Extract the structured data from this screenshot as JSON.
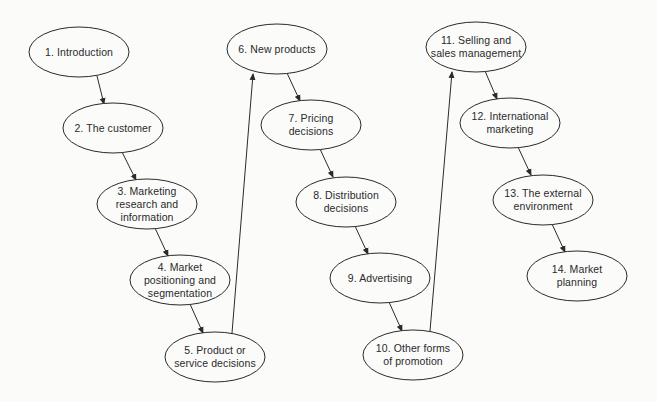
{
  "diagram": {
    "type": "flowchart",
    "background": "#fbfbfa",
    "stroke_color": "#2a2a2a",
    "nodes": [
      {
        "id": 1,
        "label": "1. Introduction",
        "cx": 79,
        "cy": 52,
        "rx": 50,
        "ry": 25
      },
      {
        "id": 2,
        "label": "2. The customer",
        "cx": 113,
        "cy": 128,
        "rx": 50,
        "ry": 25
      },
      {
        "id": 3,
        "label": "3. Marketing\nresearch and\ninformation",
        "cx": 147,
        "cy": 204,
        "rx": 50,
        "ry": 25
      },
      {
        "id": 4,
        "label": "4. Market\npositioning and\nsegmentation",
        "cx": 180,
        "cy": 280,
        "rx": 50,
        "ry": 25
      },
      {
        "id": 5,
        "label": "5. Product or\nservice decisions",
        "cx": 215,
        "cy": 357,
        "rx": 50,
        "ry": 25
      },
      {
        "id": 6,
        "label": "6. New products",
        "cx": 277,
        "cy": 49,
        "rx": 50,
        "ry": 25
      },
      {
        "id": 7,
        "label": "7. Pricing\ndecisions",
        "cx": 311,
        "cy": 125,
        "rx": 50,
        "ry": 25
      },
      {
        "id": 8,
        "label": "8. Distribution\ndecisions",
        "cx": 346,
        "cy": 202,
        "rx": 50,
        "ry": 25
      },
      {
        "id": 9,
        "label": "9. Advertising",
        "cx": 380,
        "cy": 278,
        "rx": 50,
        "ry": 25
      },
      {
        "id": 10,
        "label": "10. Other forms\nof promotion",
        "cx": 413,
        "cy": 355,
        "rx": 50,
        "ry": 25
      },
      {
        "id": 11,
        "label": "11. Selling and\nsales management",
        "cx": 476,
        "cy": 47,
        "rx": 50,
        "ry": 25
      },
      {
        "id": 12,
        "label": "12. International\nmarketing",
        "cx": 510,
        "cy": 123,
        "rx": 50,
        "ry": 25
      },
      {
        "id": 13,
        "label": "13. The external\nenvironment",
        "cx": 543,
        "cy": 200,
        "rx": 50,
        "ry": 25
      },
      {
        "id": 14,
        "label": "14. Market\nplanning",
        "cx": 577,
        "cy": 276,
        "rx": 50,
        "ry": 25
      }
    ],
    "edges": [
      {
        "from": 1,
        "to": 2,
        "x1": 97,
        "y1": 76,
        "x2": 104,
        "y2": 104
      },
      {
        "from": 2,
        "to": 3,
        "x1": 122,
        "y1": 152,
        "x2": 136,
        "y2": 180
      },
      {
        "from": 3,
        "to": 4,
        "x1": 155,
        "y1": 228,
        "x2": 168,
        "y2": 256
      },
      {
        "from": 4,
        "to": 5,
        "x1": 190,
        "y1": 304,
        "x2": 203,
        "y2": 333
      },
      {
        "from": 5,
        "to": 6,
        "x1": 232,
        "y1": 333,
        "x2": 253,
        "y2": 74
      },
      {
        "from": 6,
        "to": 7,
        "x1": 287,
        "y1": 73,
        "x2": 300,
        "y2": 101
      },
      {
        "from": 7,
        "to": 8,
        "x1": 320,
        "y1": 149,
        "x2": 333,
        "y2": 177
      },
      {
        "from": 8,
        "to": 9,
        "x1": 355,
        "y1": 226,
        "x2": 368,
        "y2": 254
      },
      {
        "from": 9,
        "to": 10,
        "x1": 389,
        "y1": 302,
        "x2": 402,
        "y2": 331
      },
      {
        "from": 10,
        "to": 11,
        "x1": 430,
        "y1": 331,
        "x2": 452,
        "y2": 72
      },
      {
        "from": 11,
        "to": 12,
        "x1": 485,
        "y1": 71,
        "x2": 497,
        "y2": 99
      },
      {
        "from": 12,
        "to": 13,
        "x1": 518,
        "y1": 147,
        "x2": 531,
        "y2": 175
      },
      {
        "from": 13,
        "to": 14,
        "x1": 552,
        "y1": 224,
        "x2": 565,
        "y2": 252
      }
    ]
  }
}
